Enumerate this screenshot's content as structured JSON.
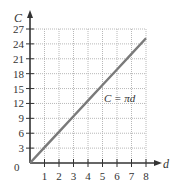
{
  "chart_data": {
    "type": "line",
    "title": "",
    "xlabel": "d",
    "ylabel": "C",
    "xlim": [
      0,
      8
    ],
    "ylim": [
      0,
      27
    ],
    "grid": true,
    "grid_style": "dotted",
    "x_ticks": [
      1,
      2,
      3,
      4,
      5,
      6,
      7,
      8
    ],
    "y_ticks": [
      3,
      6,
      9,
      12,
      15,
      18,
      21,
      24,
      27
    ],
    "origin_label": "0",
    "series": [
      {
        "name": "C = πd",
        "x": [
          0,
          1,
          2,
          3,
          4,
          5,
          6,
          7,
          8
        ],
        "y": [
          0,
          3.14,
          6.28,
          9.42,
          12.57,
          15.71,
          18.85,
          21.99,
          25.13
        ]
      }
    ],
    "annotations": [
      {
        "text": "C = πd",
        "x": 5.6,
        "y": 16.5
      }
    ],
    "colors": {
      "line": "#7a7a7a",
      "axis": "#333333",
      "grid": "#b8b8b8"
    }
  },
  "labels": {
    "x_axis": "d",
    "y_axis": "C",
    "origin": "0",
    "equation": "C = πd",
    "x_ticks": [
      "1",
      "2",
      "3",
      "4",
      "5",
      "6",
      "7",
      "8"
    ],
    "y_ticks": [
      "3",
      "6",
      "9",
      "12",
      "15",
      "18",
      "21",
      "24",
      "27"
    ]
  }
}
